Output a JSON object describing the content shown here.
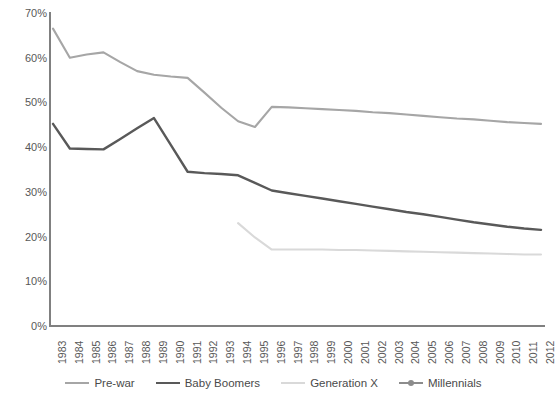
{
  "chart_data": {
    "type": "line",
    "title": "",
    "xlabel": "",
    "ylabel": "",
    "ylim": [
      0,
      70
    ],
    "ytick_labels": [
      "0%",
      "10%",
      "20%",
      "30%",
      "40%",
      "50%",
      "60%",
      "70%"
    ],
    "ytick_values": [
      0,
      10,
      20,
      30,
      40,
      50,
      60,
      70
    ],
    "grid": false,
    "legend_position": "bottom",
    "x": [
      1983,
      1984,
      1985,
      1986,
      1987,
      1988,
      1989,
      1990,
      1991,
      1992,
      1993,
      1994,
      1995,
      1996,
      1997,
      1998,
      1999,
      2000,
      2001,
      2002,
      2003,
      2004,
      2005,
      2006,
      2007,
      2008,
      2009,
      2010,
      2011,
      2012
    ],
    "xtick_labels": [
      "1983",
      "1984",
      "1985",
      "1986",
      "1987",
      "1988",
      "1989",
      "1990",
      "1991",
      "1992",
      "1993",
      "1994",
      "1995",
      "1996",
      "1997",
      "1998",
      "1999",
      "2000",
      "2001",
      "2002",
      "2003",
      "2004",
      "2005",
      "2006",
      "2007",
      "2008",
      "2009",
      "2010",
      "2011",
      "2012"
    ],
    "series": [
      {
        "name": "Pre-war",
        "color": "#a6a6a6",
        "width": 2.1,
        "marker": false,
        "values": [
          66.5,
          60.0,
          60.7,
          61.2,
          59.0,
          57.0,
          56.2,
          55.8,
          55.5,
          52.2,
          48.8,
          45.8,
          44.5,
          49.0,
          48.9,
          48.7,
          48.5,
          48.3,
          48.1,
          47.8,
          47.6,
          47.3,
          47.0,
          46.7,
          46.4,
          46.2,
          45.9,
          45.6,
          45.4,
          45.2
        ]
      },
      {
        "name": "Baby Boomers",
        "color": "#595959",
        "width": 2.4,
        "marker": false,
        "values": [
          45.2,
          39.7,
          39.6,
          39.5,
          41.8,
          44.2,
          46.5,
          40.5,
          34.5,
          34.2,
          34.0,
          33.7,
          32.0,
          30.3,
          29.7,
          29.1,
          28.5,
          27.9,
          27.3,
          26.7,
          26.1,
          25.5,
          25.0,
          24.4,
          23.8,
          23.2,
          22.7,
          22.2,
          21.8,
          21.5
        ]
      },
      {
        "name": "Generation X",
        "color": "#d9d9d9",
        "width": 2.1,
        "marker": false,
        "values": [
          null,
          null,
          null,
          null,
          null,
          null,
          null,
          null,
          null,
          null,
          null,
          23.0,
          19.8,
          17.1,
          17.1,
          17.1,
          17.1,
          17.0,
          17.0,
          16.9,
          16.8,
          16.7,
          16.6,
          16.5,
          16.4,
          16.3,
          16.2,
          16.1,
          16.0,
          16.0
        ]
      },
      {
        "name": "Millennials",
        "color": "#8c8c8c",
        "width": 2.1,
        "marker": true,
        "values": [
          null,
          null,
          null,
          null,
          null,
          null,
          null,
          null,
          null,
          null,
          null,
          null,
          null,
          null,
          null,
          null,
          null,
          null,
          null,
          null,
          null,
          null,
          null,
          null,
          null,
          null,
          null,
          null,
          null,
          null
        ]
      }
    ]
  },
  "legend": {
    "items": [
      {
        "label": "Pre-war"
      },
      {
        "label": "Baby Boomers"
      },
      {
        "label": "Generation X"
      },
      {
        "label": "Millennials"
      }
    ]
  }
}
